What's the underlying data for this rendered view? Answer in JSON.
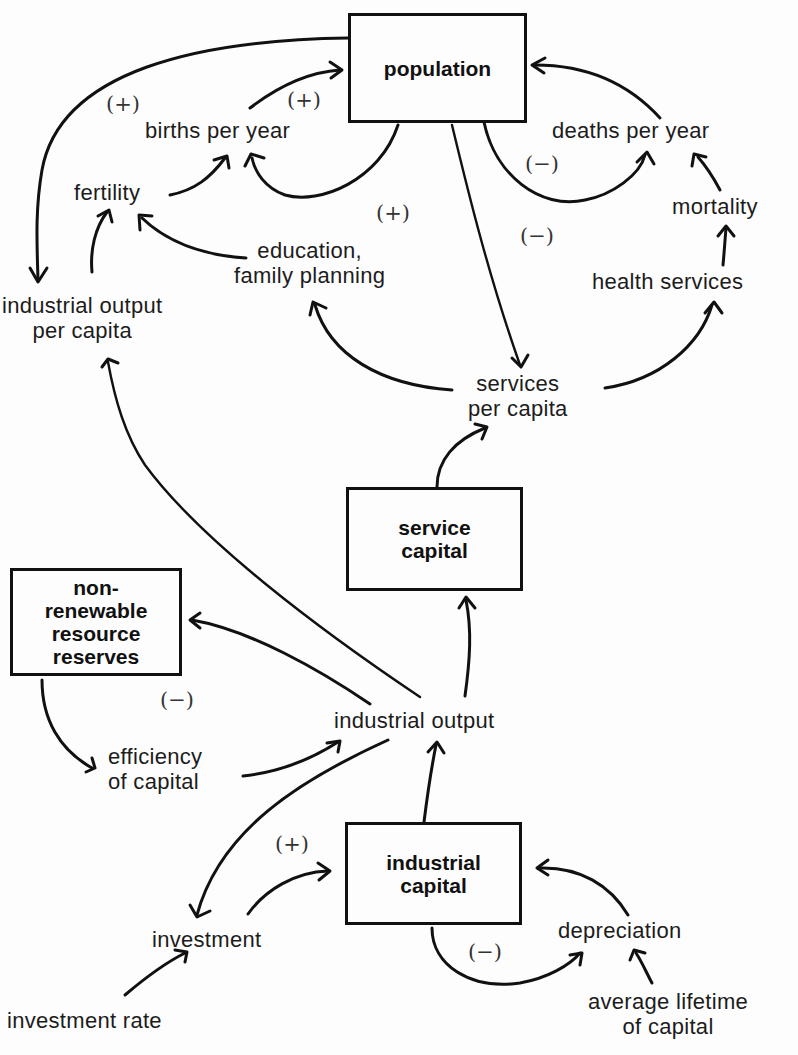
{
  "diagram": {
    "type": "causal-loop",
    "stocks": {
      "population": "population",
      "service_capital": "service\ncapital",
      "nonrenewable": "non-\nrenewable\nresource\nreserves",
      "industrial_capital": "industrial\ncapital"
    },
    "variables": {
      "births_per_year": "births per year",
      "deaths_per_year": "deaths per year",
      "fertility": "fertility",
      "mortality": "mortality",
      "education": "education,\nfamily planning",
      "health_services": "health services",
      "io_per_capita": "industrial output\nper capita",
      "services_per_capita": "services\nper capita",
      "industrial_output": "industrial output",
      "efficiency": "efficiency\nof capital",
      "investment": "investment",
      "depreciation": "depreciation",
      "investment_rate": "investment rate",
      "avg_lifetime": "average lifetime\nof capital"
    },
    "polarities": {
      "births_loop_outer": "(+)",
      "births_loop": "(+)",
      "deaths_loop": "(−)",
      "education_loop": "(+)",
      "services_loop": "(−)",
      "resources_loop": "(−)",
      "investment_loop": "(+)",
      "depreciation_loop": "(−)"
    },
    "edges": [
      {
        "from": "population",
        "to": "industrial output per capita"
      },
      {
        "from": "population",
        "to": "births per year"
      },
      {
        "from": "births per year",
        "to": "population"
      },
      {
        "from": "fertility",
        "to": "births per year"
      },
      {
        "from": "industrial output per capita",
        "to": "fertility"
      },
      {
        "from": "education, family planning",
        "to": "fertility"
      },
      {
        "from": "population",
        "to": "deaths per year"
      },
      {
        "from": "deaths per year",
        "to": "population"
      },
      {
        "from": "mortality",
        "to": "deaths per year"
      },
      {
        "from": "health services",
        "to": "mortality"
      },
      {
        "from": "population",
        "to": "services per capita"
      },
      {
        "from": "services per capita",
        "to": "education, family planning"
      },
      {
        "from": "services per capita",
        "to": "health services"
      },
      {
        "from": "service capital",
        "to": "services per capita"
      },
      {
        "from": "industrial output",
        "to": "industrial output per capita"
      },
      {
        "from": "industrial output",
        "to": "service capital"
      },
      {
        "from": "industrial output",
        "to": "non-renewable resource reserves"
      },
      {
        "from": "non-renewable resource reserves",
        "to": "efficiency of capital"
      },
      {
        "from": "efficiency of capital",
        "to": "industrial output"
      },
      {
        "from": "industrial output",
        "to": "investment"
      },
      {
        "from": "investment",
        "to": "industrial capital"
      },
      {
        "from": "industrial capital",
        "to": "industrial output"
      },
      {
        "from": "industrial capital",
        "to": "depreciation"
      },
      {
        "from": "depreciation",
        "to": "industrial capital"
      },
      {
        "from": "investment rate",
        "to": "investment"
      },
      {
        "from": "average lifetime of capital",
        "to": "depreciation"
      }
    ]
  }
}
